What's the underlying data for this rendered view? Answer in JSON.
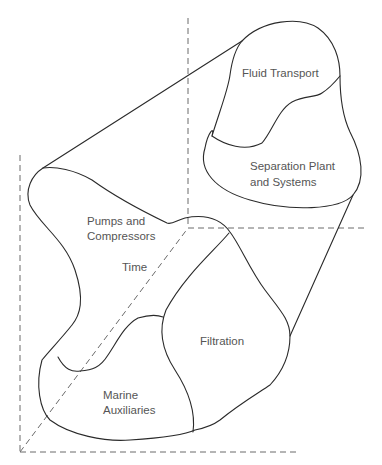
{
  "diagram": {
    "type": "3d-axes-region-diagram",
    "colors": {
      "outline": "#2a2a2a",
      "axis": "#6a6a6a",
      "text": "#555555",
      "background": "#ffffff"
    },
    "axes": {
      "time_axis_label": "Time"
    },
    "regions": {
      "fluid_transport": {
        "label": "Fluid Transport"
      },
      "separation": {
        "line1": "Separation Plant",
        "line2": "and Systems"
      },
      "pumps": {
        "line1": "Pumps and",
        "line2": "Compressors"
      },
      "filtration": {
        "label": "Filtration"
      },
      "marine": {
        "line1": "Marine",
        "line2": "Auxiliaries"
      }
    }
  }
}
